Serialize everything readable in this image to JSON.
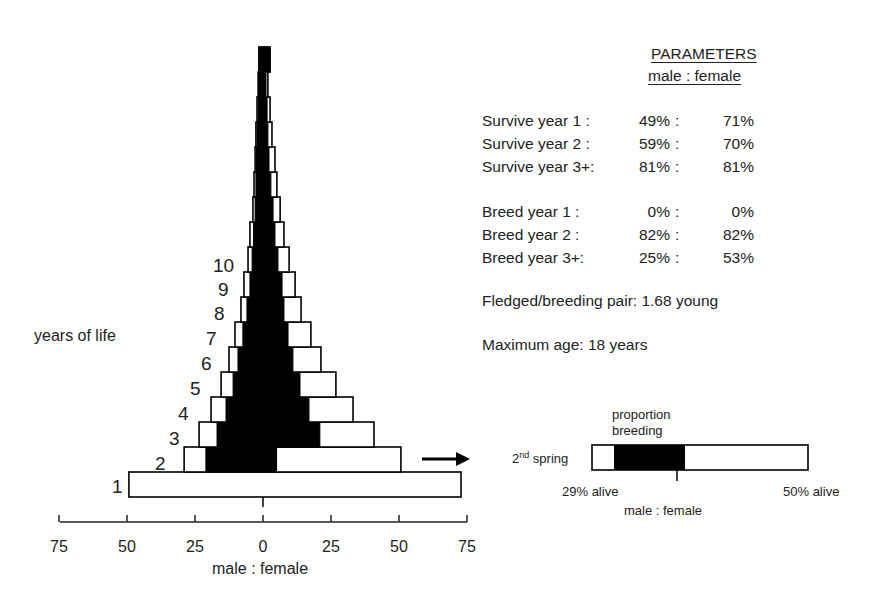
{
  "chart_data": {
    "type": "bar",
    "subtype": "population-pyramid",
    "title": "",
    "xlabel": "male : female",
    "ylabel": "years of life",
    "x_ticks": [
      75,
      50,
      25,
      0,
      25,
      50,
      75
    ],
    "xlim": [
      -75,
      75
    ],
    "grid": false,
    "legend": null,
    "categories": [
      "1",
      "2",
      "3",
      "4",
      "5",
      "6",
      "7",
      "8",
      "9",
      "10",
      "11",
      "12",
      "13",
      "14",
      "15",
      "16",
      "17",
      "18"
    ],
    "series": [
      {
        "name": "male alive",
        "values": [
          49.3,
          29.0,
          23.5,
          19.1,
          15.4,
          12.5,
          10.3,
          8.1,
          7.0,
          5.5,
          4.8,
          3.7,
          3.3,
          2.9,
          2.6,
          2.2,
          1.8,
          1.5
        ]
      },
      {
        "name": "male breeding",
        "values": [
          0,
          21.0,
          16.9,
          13.6,
          11.0,
          9.2,
          7.4,
          5.9,
          4.8,
          4.0,
          3.5,
          2.9,
          2.6,
          2.4,
          2.2,
          1.8,
          1.5,
          1.5
        ]
      },
      {
        "name": "female breeding",
        "values": [
          0,
          5.0,
          20.9,
          16.9,
          13.6,
          11.0,
          9.2,
          7.7,
          7.0,
          5.5,
          4.4,
          3.7,
          2.9,
          2.2,
          1.8,
          1.5,
          1.1,
          2.6
        ]
      },
      {
        "name": "female alive",
        "values": [
          72.8,
          50.7,
          40.8,
          33.1,
          26.8,
          21.3,
          17.6,
          14.0,
          11.8,
          9.6,
          7.7,
          6.3,
          5.1,
          4.4,
          3.3,
          2.6,
          1.8,
          2.6
        ]
      }
    ],
    "row_labels_shown": [
      "1",
      "2",
      "3",
      "4",
      "5",
      "6",
      "7",
      "8",
      "9",
      "10"
    ]
  },
  "axis": {
    "ticks": [
      "75",
      "50",
      "25",
      "0",
      "25",
      "50",
      "75"
    ],
    "label": "male : female",
    "y_label": "years of life"
  },
  "parameters": {
    "title": "PARAMETERS",
    "subtitle": "male : female",
    "survival": [
      {
        "label": "Survive year 1  :",
        "male": "49%",
        "female": "71%"
      },
      {
        "label": "Survive year 2  :",
        "male": "59%",
        "female": "70%"
      },
      {
        "label": "Survive year 3+:",
        "male": "81%",
        "female": "81%"
      }
    ],
    "breeding": [
      {
        "label": "Breed year 1  :",
        "male": "0%",
        "female": "0%"
      },
      {
        "label": "Breed year 2  :",
        "male": "82%",
        "female": "82%"
      },
      {
        "label": "Breed year 3+:",
        "male": "25%",
        "female": "53%"
      }
    ],
    "separator": ":",
    "fledged": "Fledged/breeding pair: 1.68 young",
    "max_age": "Maximum age: 18 years"
  },
  "inset": {
    "title_line1": "proportion",
    "title_line2": "breeding",
    "row_label_pre": "2",
    "row_label_sup": "nd",
    "row_label_post": " spring",
    "left_label": "29% alive",
    "right_label": "50% alive",
    "axis_label": "male : female"
  },
  "colors": {
    "ink": "#000000",
    "text": "#222222",
    "background": "#ffffff"
  }
}
